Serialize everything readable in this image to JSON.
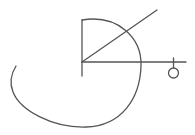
{
  "diagram": {
    "background": "#ffffff",
    "stroke_color": "#555555",
    "stroke_width": 1.3,
    "elements": {
      "vertical_axis": {
        "x1": 82,
        "y1": 20,
        "x2": 82,
        "y2": 76
      },
      "horizontal_axis": {
        "x1": 82,
        "y1": 62,
        "x2": 186,
        "y2": 62
      },
      "diagonal_ray": {
        "x1": 82,
        "y1": 62,
        "x2": 157,
        "y2": 10
      },
      "spiral_arc": {
        "d": "M82,20 C118,14 142,38 141,66 C140,98 122,126 86,127 C52,128 20,110 13,92 C9,82 11,74 16,66"
      },
      "end_tick": {
        "x1": 173.5,
        "y1": 58,
        "x2": 173.5,
        "y2": 68
      },
      "end_circle": {
        "cx": 173.5,
        "cy": 73,
        "r": 5
      }
    }
  }
}
